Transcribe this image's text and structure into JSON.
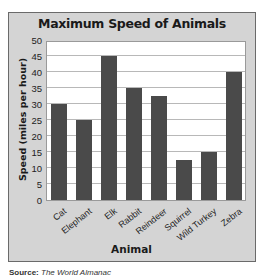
{
  "chart_data": {
    "type": "bar",
    "title": "Maximum Speed of Animals",
    "xlabel": "Animal",
    "ylabel": "Speed (miles per hour)",
    "categories": [
      "Cat",
      "Elephant",
      "Elk",
      "Rabbit",
      "Reindeer",
      "Squirrel",
      "Wild Turkey",
      "Zebra"
    ],
    "values": [
      30,
      25,
      45,
      35,
      32.5,
      12.5,
      15,
      40
    ],
    "ylim": [
      0,
      50
    ],
    "yticks": [
      0,
      5,
      10,
      15,
      20,
      25,
      30,
      35,
      40,
      45,
      50
    ],
    "grid": true,
    "legend": null,
    "bar_color": "#4a4a4a",
    "background_color": "#d4d4d4",
    "plot_background": "#ffffff"
  },
  "source": {
    "label": "Source:",
    "text": "The World Almanac"
  }
}
